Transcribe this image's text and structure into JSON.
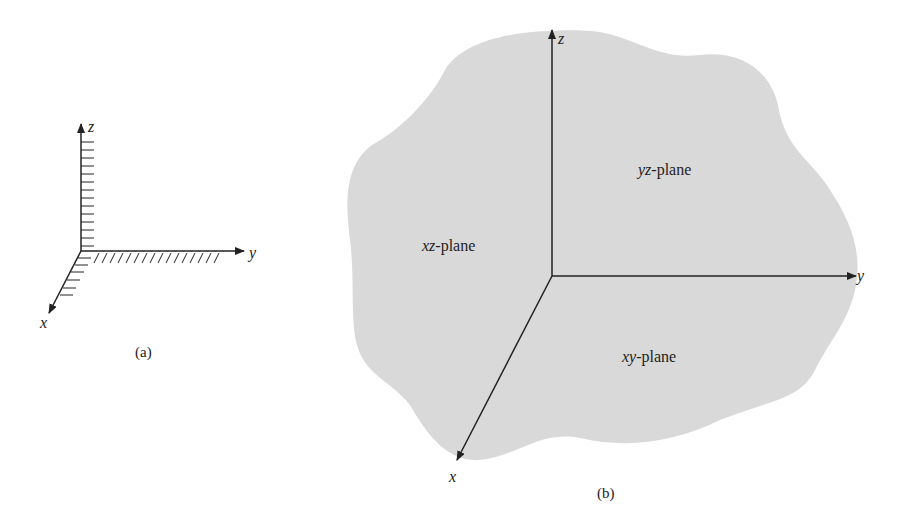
{
  "figure_a": {
    "caption": "(a)",
    "axes": {
      "x": "x",
      "y": "y",
      "z": "z"
    }
  },
  "figure_b": {
    "caption": "(b)",
    "axes": {
      "x": "x",
      "y": "y",
      "z": "z"
    },
    "planes": [
      {
        "prefix": "yz",
        "suffix": "-plane"
      },
      {
        "prefix": "xz",
        "suffix": "-plane"
      },
      {
        "prefix": "xy",
        "suffix": "-plane"
      }
    ]
  },
  "colors": {
    "plane_fill": "#d9d9d9",
    "ink": "#222222"
  }
}
